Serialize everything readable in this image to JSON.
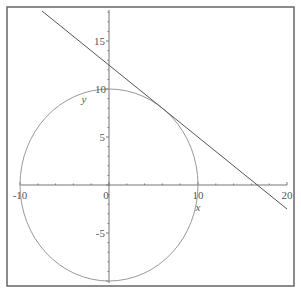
{
  "chart_data": {
    "type": "line",
    "title": "",
    "xlabel": "x",
    "ylabel": "y",
    "xlim": [
      -10,
      20
    ],
    "ylim": [
      -10,
      18
    ],
    "grid": false,
    "legend": null,
    "x_ticks": [
      "-10",
      "0",
      "10",
      "20"
    ],
    "y_ticks": [
      "-5",
      "5",
      "10",
      "15"
    ],
    "origin_label": "0",
    "series": [
      {
        "name": "circle",
        "kind": "implicit",
        "equation": "x^2 + y^2 = 100",
        "center": [
          0,
          0
        ],
        "radius": 10,
        "color": "#999999"
      },
      {
        "name": "tangent line",
        "kind": "line",
        "equation": "y = 12.5 - 0.75x",
        "points": [
          [
            -7.5,
            18.1
          ],
          [
            0,
            12.5
          ],
          [
            6,
            8
          ],
          [
            16.67,
            0
          ],
          [
            20,
            -2.5
          ]
        ],
        "color": "#555555"
      }
    ]
  },
  "frame": {
    "color": "#666666"
  },
  "axes": {
    "color": "#777777"
  }
}
